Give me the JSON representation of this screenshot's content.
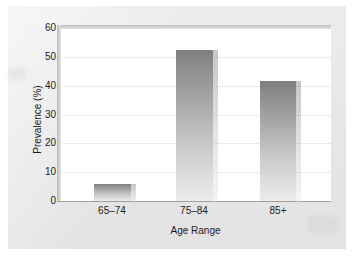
{
  "chart_data": {
    "type": "bar",
    "title": "",
    "xlabel": "Age Range",
    "ylabel": "Prevalence (%)",
    "categories": [
      "65–74",
      "75–84",
      "85+"
    ],
    "values": [
      6,
      52.5,
      41.5
    ],
    "ylim": [
      0,
      60
    ],
    "yticks": [
      0,
      10,
      20,
      30,
      40,
      50,
      60
    ],
    "ytick_labels": [
      "0",
      "10",
      "20",
      "30",
      "40",
      "50",
      "60"
    ],
    "grid": true,
    "legend": false,
    "series": [
      {
        "name": "Prevalence",
        "values": [
          6,
          52.5,
          41.5
        ]
      }
    ]
  },
  "style": {
    "panel_background": "#e9e9e9",
    "plot_background": "#ffffff",
    "bar_color_top": "#7d7d7d",
    "bar_color_bottom": "#ececec",
    "gridline_color": "#d6d6d6",
    "axis_color": "#9f9f9f",
    "text_color": "#1d1d1d"
  }
}
